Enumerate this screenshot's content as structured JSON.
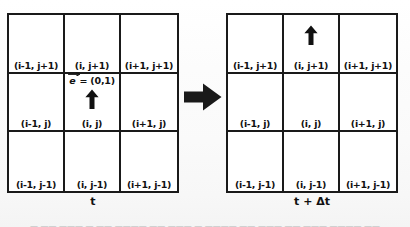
{
  "figure": {
    "ink_color": "#1a1a1a",
    "paper_color": "#fdfdfd"
  },
  "panels": [
    {
      "id": "before",
      "time_caption": "t",
      "grid": {
        "rows": 3,
        "cols": 3,
        "cells": [
          {
            "label": "(i-1, j+1)",
            "arrow": false,
            "vector_label": false
          },
          {
            "label": "(i, j+1)",
            "arrow": false,
            "vector_label": false
          },
          {
            "label": "(i+1, j+1)",
            "arrow": false,
            "vector_label": false
          },
          {
            "label": "(i-1, j)",
            "arrow": false,
            "vector_label": false
          },
          {
            "label": "(i, j)",
            "arrow": true,
            "vector_label": true
          },
          {
            "label": "(i+1, j)",
            "arrow": false,
            "vector_label": false
          },
          {
            "label": "(i-1, j-1)",
            "arrow": false,
            "vector_label": false
          },
          {
            "label": "(i, j-1)",
            "arrow": false,
            "vector_label": false
          },
          {
            "label": "(i+1, j-1)",
            "arrow": false,
            "vector_label": false
          }
        ]
      }
    },
    {
      "id": "after",
      "time_caption": "t + Δt",
      "grid": {
        "rows": 3,
        "cols": 3,
        "cells": [
          {
            "label": "(i-1, j+1)",
            "arrow": false,
            "vector_label": false
          },
          {
            "label": "(i, j+1)",
            "arrow": true,
            "vector_label": false
          },
          {
            "label": "(i+1, j+1)",
            "arrow": false,
            "vector_label": false
          },
          {
            "label": "(i-1, j)",
            "arrow": false,
            "vector_label": false
          },
          {
            "label": "(i, j)",
            "arrow": false,
            "vector_label": false
          },
          {
            "label": "(i+1, j)",
            "arrow": false,
            "vector_label": false
          },
          {
            "label": "(i-1, j-1)",
            "arrow": false,
            "vector_label": false
          },
          {
            "label": "(i, j-1)",
            "arrow": false,
            "vector_label": false
          },
          {
            "label": "(i+1, j-1)",
            "arrow": false,
            "vector_label": false
          }
        ]
      }
    }
  ],
  "vector": {
    "symbol": "e",
    "equals": "=",
    "value": "(0,1)",
    "full_text": "e = (0,1)"
  },
  "transition": {
    "icon": "right-arrow-icon",
    "direction": "right"
  },
  "bottom_caption": {
    "text": "— —— ——— — —— ———— —— ——— — ———— —— ——— —— ——— ———— ——",
    "legible": false
  }
}
